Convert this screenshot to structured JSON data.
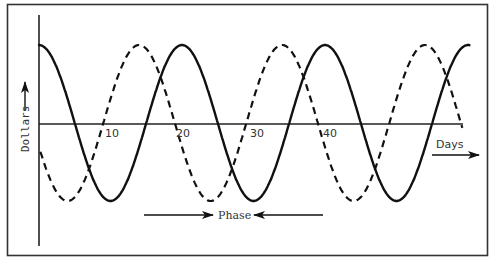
{
  "figure": {
    "y_axis_label": "Dollars",
    "x_axis_label": "Days",
    "annotation": "Phase",
    "ticks": [
      "10",
      "20",
      "30",
      "40"
    ]
  },
  "chart_data": {
    "type": "line",
    "title": "",
    "xlabel": "Days",
    "ylabel": "Dollars",
    "x_ticks": [
      10,
      20,
      30,
      40
    ],
    "xlim": [
      0,
      60
    ],
    "grid": false,
    "legend": null,
    "annotations": [
      {
        "text": "Phase",
        "type": "double-arrow-inward",
        "meaning": "phase difference between the two cycles"
      }
    ],
    "series": [
      {
        "name": "cycle A (solid)",
        "style": "solid",
        "shape": "cosine",
        "period_days": 20,
        "peaks_days": [
          0,
          20,
          40,
          60
        ],
        "troughs_days": [
          10,
          30,
          50
        ]
      },
      {
        "name": "cycle B (dashed)",
        "style": "dashed",
        "shape": "cosine",
        "period_days": 20,
        "peaks_days": [
          14,
          34,
          54
        ],
        "troughs_days": [
          4,
          24,
          44
        ]
      }
    ],
    "phase_offset_days": 6
  }
}
